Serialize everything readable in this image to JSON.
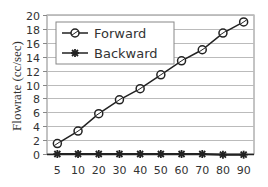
{
  "chart_data": {
    "type": "line",
    "title": "",
    "xlabel": "",
    "ylabel": "Flowrate (cc/sec)",
    "categories": [
      "5",
      "10",
      "20",
      "30",
      "40",
      "50",
      "60",
      "70",
      "80",
      "90"
    ],
    "series": [
      {
        "name": "Forward",
        "marker": "circle",
        "values": [
          1.5,
          3.3,
          5.8,
          7.8,
          9.4,
          11.4,
          13.4,
          15.0,
          17.4,
          19.0
        ]
      },
      {
        "name": "Backward",
        "marker": "asterisk",
        "values": [
          0,
          0,
          0,
          0,
          0,
          0,
          0,
          0,
          -0.1,
          -0.1
        ]
      }
    ],
    "ylim": [
      0,
      20
    ],
    "yticks": [
      0,
      2,
      4,
      6,
      8,
      10,
      12,
      14,
      16,
      18,
      20
    ],
    "grid": true,
    "legend_position": "upper-left-inside"
  },
  "colors": {
    "line": "#222222",
    "grid": "#bbbbbb",
    "axis": "#888888",
    "text": "#333333"
  }
}
